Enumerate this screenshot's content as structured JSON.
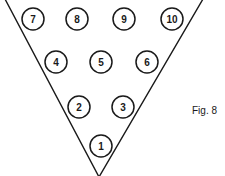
{
  "figure": {
    "caption": "Fig. 8",
    "stroke_color": "#1a1a1a",
    "background_color": "#ffffff",
    "triangle": {
      "points": [
        [
          5,
          -1
        ],
        [
          203,
          -1
        ],
        [
          99,
          177
        ]
      ]
    },
    "circle_radius": 11,
    "pins": [
      {
        "label": "7",
        "cx": 33,
        "cy": 19
      },
      {
        "label": "8",
        "cx": 77,
        "cy": 19
      },
      {
        "label": "9",
        "cx": 124,
        "cy": 19
      },
      {
        "label": "10",
        "cx": 172,
        "cy": 19
      },
      {
        "label": "4",
        "cx": 56,
        "cy": 62
      },
      {
        "label": "5",
        "cx": 101,
        "cy": 62
      },
      {
        "label": "6",
        "cx": 147,
        "cy": 62
      },
      {
        "label": "2",
        "cx": 79,
        "cy": 107
      },
      {
        "label": "3",
        "cx": 123,
        "cy": 107
      },
      {
        "label": "1",
        "cx": 101,
        "cy": 146
      }
    ]
  }
}
